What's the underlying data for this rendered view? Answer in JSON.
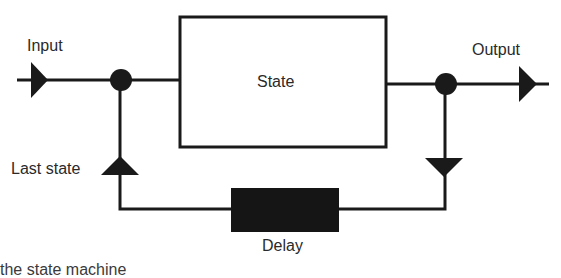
{
  "diagram": {
    "type": "state-machine-block-diagram",
    "labels": {
      "input": "Input",
      "output": "Output",
      "state": "State",
      "last_state": "Last state",
      "delay": "Delay"
    },
    "caption_partial": "the state machine",
    "colors": {
      "stroke": "#1a1a1a",
      "fill_dark": "#151515",
      "background": "#ffffff",
      "text": "#2a2a2a"
    },
    "nodes": [
      {
        "id": "state",
        "label": "State",
        "kind": "box-outline"
      },
      {
        "id": "delay",
        "label": "Delay",
        "kind": "box-filled"
      },
      {
        "id": "junction-in",
        "kind": "dot"
      },
      {
        "id": "junction-out",
        "kind": "dot"
      }
    ],
    "edges": [
      {
        "from": "input",
        "to": "junction-in"
      },
      {
        "from": "junction-in",
        "to": "state"
      },
      {
        "from": "state",
        "to": "junction-out"
      },
      {
        "from": "junction-out",
        "to": "output"
      },
      {
        "from": "junction-out",
        "to": "delay",
        "direction": "down"
      },
      {
        "from": "delay",
        "to": "junction-in",
        "label": "Last state",
        "direction": "up"
      }
    ]
  }
}
